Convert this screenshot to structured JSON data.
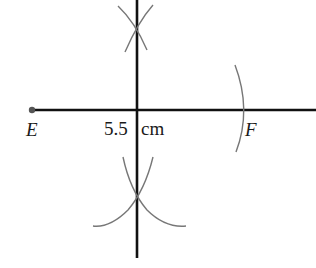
{
  "diagram": {
    "type": "perpendicular-bisector-construction",
    "points": [
      {
        "name": "E",
        "label": "E"
      },
      {
        "name": "F",
        "label": "F"
      }
    ],
    "measurement": {
      "value": "5.5",
      "unit": "cm"
    },
    "colors": {
      "line": "#111111",
      "arc": "#777777",
      "point": "#555555",
      "text": "#1a1a1a"
    }
  }
}
